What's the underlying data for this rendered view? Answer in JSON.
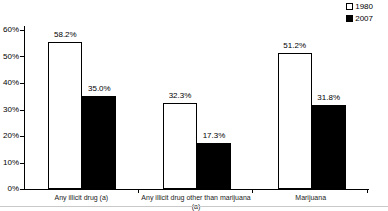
{
  "chart_data": {
    "type": "bar",
    "title": "",
    "categories": [
      "Any illicit drug (a)",
      "Any illicit drug other than marijuana (a)",
      "Marijuana"
    ],
    "series": [
      {
        "name": "1980",
        "color": "#ffffff",
        "values": [
          58.2,
          32.3,
          51.2
        ],
        "labels": [
          "58.2%",
          "32.3%",
          "51.2%"
        ]
      },
      {
        "name": "2007",
        "color": "#000000",
        "values": [
          35.0,
          17.3,
          31.8
        ],
        "labels": [
          "35.0%",
          "17.3%",
          "31.8%"
        ]
      }
    ],
    "ylabel": "",
    "xlabel": "",
    "ylim": [
      0,
      60
    ],
    "y_ticks": [
      "0%",
      "10%",
      "20%",
      "30%",
      "40%",
      "50%",
      "60%"
    ],
    "grid": false,
    "legend_position": "top-right",
    "axis_color": "#000000",
    "background_color": "#ffffff"
  }
}
